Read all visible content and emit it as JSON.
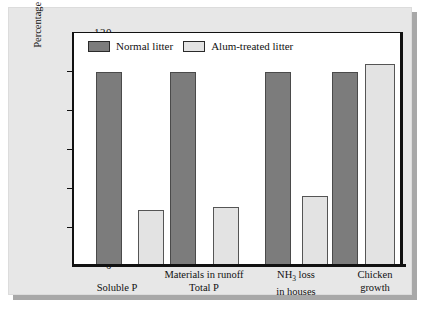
{
  "chart_data": {
    "type": "bar",
    "title": "",
    "xlabel": "",
    "ylabel": "Percentage of control (normal litter)",
    "ylim": [
      0,
      120
    ],
    "yticks": [
      0,
      20,
      40,
      60,
      80,
      100,
      120
    ],
    "grid": false,
    "legend_position": "top-left",
    "categories": [
      "Soluble P",
      "Total P",
      "NH3 loss in houses",
      "Chicken growth"
    ],
    "group_headers": [
      {
        "label": "Materials in runoff",
        "spans": [
          "Soluble P",
          "Total P"
        ]
      }
    ],
    "series": [
      {
        "name": "Normal litter",
        "color": "#7c7c7c",
        "values": [
          100,
          100,
          100,
          100
        ]
      },
      {
        "name": "Alum-treated litter",
        "color": "#e3e3e3",
        "values": [
          28.5,
          30,
          35.5,
          104
        ]
      }
    ]
  },
  "axis": {
    "y_label": "Percentage of control (normal litter)",
    "y_ticks": [
      "120",
      "100",
      "80",
      "60",
      "40",
      "20",
      "0"
    ]
  },
  "legend": {
    "items": [
      {
        "label": "Normal litter",
        "swatch": "dark-gray-swatch"
      },
      {
        "label": "Alum-treated litter",
        "swatch": "light-gray-swatch"
      }
    ]
  },
  "x_axis": {
    "groups": [
      {
        "top": "",
        "bottom": "Soluble P"
      },
      {
        "top": "Materials in runoff",
        "bottom": "Total P"
      },
      {
        "top": "NH3 loss",
        "bottom": "in houses",
        "subscript": "3",
        "top_prefix": "NH",
        "top_suffix": " loss"
      },
      {
        "top": "Chicken",
        "bottom": "growth"
      }
    ]
  },
  "colors": {
    "normal_litter": "#7c7c7c",
    "alum_treated_litter": "#e3e3e3",
    "panel_background": "#e7e7e7",
    "plot_background": "#ffffff",
    "axis": "#111111"
  }
}
